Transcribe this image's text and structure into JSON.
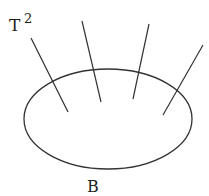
{
  "diagram": {
    "fiber_label": "T",
    "fiber_label_exponent": "2",
    "base_label": "B",
    "stroke_color": "#333333",
    "base_ellipse": {
      "cx": 108,
      "cy": 119,
      "rx": 84,
      "ry": 50
    },
    "fibers": [
      {
        "x1": 31,
        "y1": 38,
        "x2": 68,
        "y2": 112
      },
      {
        "x1": 82,
        "y1": 21,
        "x2": 101,
        "y2": 102
      },
      {
        "x1": 149,
        "y1": 24,
        "x2": 133,
        "y2": 99
      },
      {
        "x1": 203,
        "y1": 45,
        "x2": 163,
        "y2": 115
      }
    ]
  }
}
